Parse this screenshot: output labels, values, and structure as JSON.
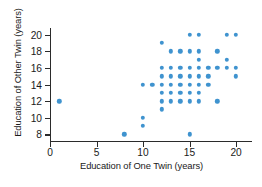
{
  "chart_data": {
    "type": "scatter",
    "title": "",
    "xlabel": "Education of One Twin (years)",
    "ylabel": "Education of Other Twin (years)",
    "xlim": [
      0,
      21.5
    ],
    "ylim": [
      7.2,
      20.8
    ],
    "xticks": [
      0,
      5,
      10,
      15,
      20
    ],
    "yticks": [
      8,
      10,
      12,
      14,
      16,
      18,
      20
    ],
    "xtick_labels": [
      "0",
      "5",
      "10",
      "15",
      "20"
    ],
    "ytick_labels": [
      "8",
      "10",
      "12",
      "14",
      "16",
      "18",
      "20"
    ],
    "grid": false,
    "legend": null,
    "marker_color": "#3f93cf",
    "axis_color": "#2b2b2b",
    "points": [
      [
        1,
        12
      ],
      [
        8,
        8
      ],
      [
        10,
        9
      ],
      [
        10,
        10
      ],
      [
        10,
        14
      ],
      [
        11,
        14
      ],
      [
        12,
        11
      ],
      [
        12,
        12
      ],
      [
        12,
        13
      ],
      [
        12,
        14
      ],
      [
        12,
        15
      ],
      [
        12,
        16
      ],
      [
        12,
        19
      ],
      [
        13,
        12
      ],
      [
        13,
        13
      ],
      [
        13,
        14
      ],
      [
        13,
        15
      ],
      [
        13,
        16
      ],
      [
        13,
        18
      ],
      [
        14,
        12
      ],
      [
        14,
        13
      ],
      [
        14,
        14
      ],
      [
        14,
        15
      ],
      [
        14,
        16
      ],
      [
        14,
        18
      ],
      [
        15,
        8
      ],
      [
        15,
        12
      ],
      [
        15,
        13
      ],
      [
        15,
        14
      ],
      [
        15,
        15
      ],
      [
        15,
        16
      ],
      [
        15,
        18
      ],
      [
        15,
        20
      ],
      [
        16,
        12
      ],
      [
        16,
        13
      ],
      [
        16,
        14
      ],
      [
        16,
        15
      ],
      [
        16,
        16
      ],
      [
        16,
        17
      ],
      [
        16,
        18
      ],
      [
        16,
        20
      ],
      [
        17,
        14
      ],
      [
        17,
        15
      ],
      [
        17,
        16
      ],
      [
        18,
        12
      ],
      [
        18,
        16
      ],
      [
        18,
        18
      ],
      [
        19,
        16
      ],
      [
        19,
        17
      ],
      [
        19,
        20
      ],
      [
        20,
        15
      ],
      [
        20,
        16
      ],
      [
        20,
        20
      ]
    ]
  }
}
